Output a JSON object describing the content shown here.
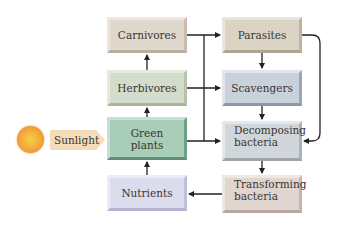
{
  "diagram": {
    "type": "flow-diagram",
    "source": {
      "sun_icon": "sun-icon",
      "label": "Sunlight"
    },
    "nodes": {
      "carnivores": {
        "label": "Carnivores",
        "color": "#d9cfc3"
      },
      "herbivores": {
        "label": "Herbivores",
        "color": "#cfd7c4"
      },
      "green_plants": {
        "label": "Green\nplants",
        "line1": "Green",
        "line2": "plants",
        "color": "#9cc3ae"
      },
      "nutrients": {
        "label": "Nutrients",
        "color": "#d6d6ea"
      },
      "parasites": {
        "label": "Parasites",
        "color": "#d6cdbd"
      },
      "scavengers": {
        "label": "Scavengers",
        "color": "#c3cbd4"
      },
      "decomposing_bacteria": {
        "label": "Decomposing bacteria",
        "line1": "Decomposing",
        "line2": "bacteria",
        "color": "#ccd1d6"
      },
      "transforming_bacteria": {
        "label": "Transforming bacteria",
        "line1": "Transforming",
        "line2": "bacteria",
        "color": "#ddd2ca"
      }
    },
    "edges": [
      {
        "from": "Sunlight",
        "to": "Green plants"
      },
      {
        "from": "Nutrients",
        "to": "Green plants"
      },
      {
        "from": "Green plants",
        "to": "Herbivores"
      },
      {
        "from": "Herbivores",
        "to": "Carnivores"
      },
      {
        "from": "Carnivores",
        "to": "Parasites"
      },
      {
        "from": "Herbivores",
        "to": "Scavengers"
      },
      {
        "from": "Parasites",
        "to": "Scavengers"
      },
      {
        "from": "Scavengers",
        "to": "Decomposing bacteria"
      },
      {
        "from": "Carnivores",
        "to": "Decomposing bacteria"
      },
      {
        "from": "Green plants",
        "to": "Decomposing bacteria"
      },
      {
        "from": "Parasites",
        "to": "Decomposing bacteria"
      },
      {
        "from": "Decomposing bacteria",
        "to": "Transforming bacteria"
      },
      {
        "from": "Transforming bacteria",
        "to": "Nutrients"
      }
    ]
  }
}
